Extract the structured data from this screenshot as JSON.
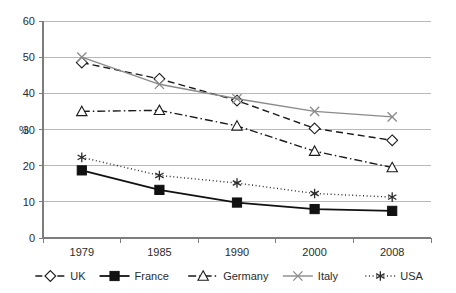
{
  "chart_data": {
    "type": "line",
    "title": "",
    "xlabel": "",
    "ylabel": "%",
    "categories": [
      "1979",
      "1985",
      "1990",
      "2000",
      "2008"
    ],
    "ylim": [
      0,
      60
    ],
    "ytick_step": 10,
    "yticks": [
      "0",
      "10",
      "20",
      "30",
      "40",
      "50",
      "60"
    ],
    "grid": "horizontal",
    "legend_position": "bottom",
    "series": [
      {
        "name": "UK",
        "values": [
          48.5,
          44.0,
          38.0,
          30.3,
          27.0
        ],
        "marker": "diamond-open",
        "line_style": "dashed",
        "color": "#1a1a1a"
      },
      {
        "name": "France",
        "values": [
          18.7,
          13.3,
          9.8,
          8.0,
          7.5
        ],
        "marker": "square-filled",
        "line_style": "solid",
        "color": "#111111"
      },
      {
        "name": "Germany",
        "values": [
          35.0,
          35.3,
          31.0,
          24.0,
          19.5
        ],
        "marker": "triangle-open",
        "line_style": "dash-dot",
        "color": "#1a1a1a"
      },
      {
        "name": "Italy",
        "values": [
          50.0,
          42.5,
          38.5,
          35.0,
          33.5
        ],
        "marker": "cross-x",
        "line_style": "solid",
        "color": "#8a8a8a"
      },
      {
        "name": "USA",
        "values": [
          22.3,
          17.3,
          15.2,
          12.3,
          11.3
        ],
        "marker": "asterisk",
        "line_style": "dotted",
        "color": "#2b2b2b"
      }
    ]
  },
  "legend": {
    "items": [
      {
        "label": "UK"
      },
      {
        "label": "France"
      },
      {
        "label": "Germany"
      },
      {
        "label": "Italy"
      },
      {
        "label": "USA"
      }
    ]
  },
  "colors": {
    "grid": "#b9b9b9",
    "axis": "#7d7d7d",
    "background": "#ffffff",
    "italy_gray": "#8a8a8a"
  }
}
